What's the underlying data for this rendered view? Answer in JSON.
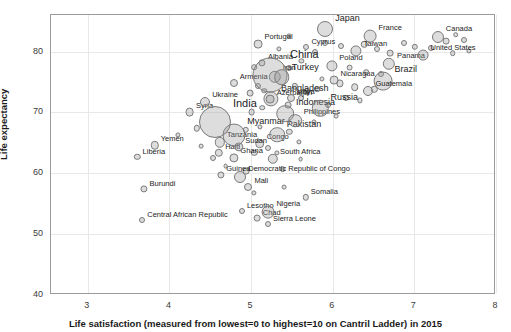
{
  "chart_data": {
    "type": "scatter",
    "title": "",
    "xlabel": "Life satisfaction (measured from lowest=0 to highest=10 on Cantril Ladder) in 2015",
    "ylabel": "Life expectancy",
    "xlim": [
      2.55,
      8.0
    ],
    "ylim": [
      40,
      86
    ],
    "xticks": [
      3,
      4,
      5,
      6,
      7,
      8
    ],
    "yticks": [
      40,
      50,
      60,
      70,
      80
    ],
    "grid": true,
    "legend": "none",
    "size_encodes": "population",
    "points": [
      {
        "label": "Central African Republic",
        "x": 3.68,
        "y": 52.2,
        "r": 3,
        "lp": "right"
      },
      {
        "label": "Liberia",
        "x": 3.62,
        "y": 62.5,
        "r": 3.2,
        "lp": "right"
      },
      {
        "label": "Burundi",
        "x": 3.7,
        "y": 57.2,
        "r": 3.6,
        "lp": "right"
      },
      {
        "label": "Yemen",
        "x": 3.83,
        "y": 64.4,
        "r": 4.2,
        "lp": "right"
      },
      {
        "label": "Syria",
        "x": 4.26,
        "y": 69.9,
        "r": 4.4,
        "lp": "right"
      },
      {
        "label": "Tanzania",
        "x": 4.63,
        "y": 64.9,
        "r": 5.2,
        "lp": "right"
      },
      {
        "label": "Haiti",
        "x": 4.62,
        "y": 63.2,
        "r": 4.2,
        "lp": "right"
      },
      {
        "label": "Ghana",
        "x": 4.8,
        "y": 62.4,
        "r": 4.6,
        "lp": "right"
      },
      {
        "label": "Guinea",
        "x": 4.64,
        "y": 59.6,
        "r": 3.6,
        "lp": "right"
      },
      {
        "label": "Democratic Republic of Congo",
        "x": 4.88,
        "y": 59.3,
        "r": 6.0,
        "lp": "right"
      },
      {
        "label": "Mali",
        "x": 4.98,
        "y": 57.5,
        "r": 4.0,
        "lp": "right"
      },
      {
        "label": "Lesotho",
        "x": 4.9,
        "y": 53.6,
        "r": 3.0,
        "lp": "right"
      },
      {
        "label": "Chad",
        "x": 5.09,
        "y": 52.5,
        "r": 3.4,
        "lp": "right"
      },
      {
        "label": "Nigeria",
        "x": 5.22,
        "y": 53.4,
        "r": 6.4,
        "lp": "right"
      },
      {
        "label": "Sierra Leone",
        "x": 5.22,
        "y": 51.5,
        "r": 3.0,
        "lp": "right"
      },
      {
        "label": "Somalia",
        "x": 5.68,
        "y": 55.9,
        "r": 3.2,
        "lp": "right"
      },
      {
        "label": "South Africa",
        "x": 5.28,
        "y": 62.2,
        "r": 5.2,
        "lp": "right"
      },
      {
        "label": "Congo",
        "x": 5.12,
        "y": 64.7,
        "r": 4.8,
        "lp": "right"
      },
      {
        "label": "Sudan",
        "x": 4.86,
        "y": 64.1,
        "r": 4.6,
        "lp": "right"
      },
      {
        "label": "Myanmar",
        "x": 4.8,
        "y": 66.1,
        "r": 11.5,
        "lp": "right"
      },
      {
        "label": "India",
        "x": 4.57,
        "y": 68.3,
        "r": 16.0,
        "lp": "right",
        "size": "big"
      },
      {
        "label": "Ukraine",
        "x": 4.45,
        "y": 71.5,
        "r": 5.0,
        "lp": "right"
      },
      {
        "label": "Armenia",
        "x": 4.8,
        "y": 74.7,
        "r": 4.0,
        "lp": "right"
      },
      {
        "label": "Albania",
        "x": 5.15,
        "y": 78.0,
        "r": 3.6,
        "lp": "right"
      },
      {
        "label": "Iran",
        "x": 5.3,
        "y": 75.7,
        "r": 6.2,
        "lp": "right"
      },
      {
        "label": "Bangladesh",
        "x": 5.26,
        "y": 72.1,
        "r": 7.6,
        "lp": "right"
      },
      {
        "label": "Pakistan",
        "x": 5.33,
        "y": 66.2,
        "r": 7.8,
        "lp": "right"
      },
      {
        "label": "Indonesia",
        "x": 5.43,
        "y": 69.6,
        "r": 8.8,
        "lp": "right"
      },
      {
        "label": "Azerbaijan",
        "x": 5.25,
        "y": 72.0,
        "r": 4.4,
        "lp": "right"
      },
      {
        "label": "Libya",
        "x": 5.5,
        "y": 72.2,
        "r": 4.0,
        "lp": "right"
      },
      {
        "label": "Philippines",
        "x": 5.55,
        "y": 68.5,
        "r": 6.8,
        "lp": "right"
      },
      {
        "label": "Russia",
        "x": 5.86,
        "y": 70.5,
        "r": 8.2,
        "lp": "right"
      },
      {
        "label": "China",
        "x": 5.25,
        "y": 76.0,
        "r": 17.5,
        "lp": "right",
        "size": "big"
      },
      {
        "label": "Turkey",
        "x": 5.39,
        "y": 75.6,
        "r": 7.8,
        "lp": "right"
      },
      {
        "label": "Portugal",
        "x": 5.1,
        "y": 81.1,
        "r": 4.4,
        "lp": "right"
      },
      {
        "label": "Cyprus",
        "x": 5.69,
        "y": 80.5,
        "r": 3.0,
        "lp": "right"
      },
      {
        "label": "Japan",
        "x": 5.92,
        "y": 83.6,
        "r": 8.0,
        "lp": "right"
      },
      {
        "label": "Poland",
        "x": 6.0,
        "y": 77.5,
        "r": 5.6,
        "lp": "right"
      },
      {
        "label": "Nicaragua",
        "x": 6.03,
        "y": 75.1,
        "r": 4.4,
        "lp": "right"
      },
      {
        "label": "Taiwan",
        "x": 6.3,
        "y": 79.9,
        "r": 5.6,
        "lp": "right"
      },
      {
        "label": "France",
        "x": 6.47,
        "y": 82.4,
        "r": 6.4,
        "lp": "right"
      },
      {
        "label": "Panama",
        "x": 6.7,
        "y": 77.8,
        "r": 6.2,
        "lp": "right"
      },
      {
        "label": "Brazil",
        "x": 6.63,
        "y": 75.0,
        "r": 9.4,
        "lp": "right"
      },
      {
        "label": "Guatemala",
        "x": 6.45,
        "y": 73.3,
        "r": 5.0,
        "lp": "right"
      },
      {
        "label": "Canada",
        "x": 7.3,
        "y": 82.2,
        "r": 6.0,
        "lp": "right"
      },
      {
        "label": "United States",
        "x": 7.12,
        "y": 79.2,
        "r": 5.4,
        "lp": "right"
      }
    ],
    "extra_points": [
      {
        "x": 4.12,
        "y": 66.2,
        "r": 2.6
      },
      {
        "x": 4.35,
        "y": 67.2,
        "r": 3.2
      },
      {
        "x": 4.55,
        "y": 62.3,
        "r": 3.0
      },
      {
        "x": 4.7,
        "y": 61.0,
        "r": 2.4
      },
      {
        "x": 4.95,
        "y": 60.2,
        "r": 3.4
      },
      {
        "x": 4.4,
        "y": 64.3,
        "r": 2.4
      },
      {
        "x": 5.05,
        "y": 56.6,
        "r": 2.6
      },
      {
        "x": 5.42,
        "y": 57.6,
        "r": 2.4
      },
      {
        "x": 5.4,
        "y": 60.5,
        "r": 2.8
      },
      {
        "x": 5.05,
        "y": 63.2,
        "r": 3.2
      },
      {
        "x": 5.22,
        "y": 64.0,
        "r": 3.0
      },
      {
        "x": 5.33,
        "y": 63.2,
        "r": 2.6
      },
      {
        "x": 4.95,
        "y": 67.0,
        "r": 3.2
      },
      {
        "x": 5.12,
        "y": 67.4,
        "r": 2.6
      },
      {
        "x": 5.48,
        "y": 66.6,
        "r": 3.2
      },
      {
        "x": 5.6,
        "y": 65.0,
        "r": 2.6
      },
      {
        "x": 5.02,
        "y": 69.9,
        "r": 3.4
      },
      {
        "x": 5.15,
        "y": 70.6,
        "r": 2.8
      },
      {
        "x": 5.47,
        "y": 71.0,
        "r": 3.4
      },
      {
        "x": 5.62,
        "y": 72.2,
        "r": 3.0
      },
      {
        "x": 5.0,
        "y": 73.0,
        "r": 3.4
      },
      {
        "x": 5.17,
        "y": 73.4,
        "r": 2.8
      },
      {
        "x": 5.1,
        "y": 74.2,
        "r": 3.0
      },
      {
        "x": 5.55,
        "y": 74.1,
        "r": 3.2
      },
      {
        "x": 5.7,
        "y": 73.4,
        "r": 3.0
      },
      {
        "x": 5.82,
        "y": 73.6,
        "r": 2.8
      },
      {
        "x": 5.05,
        "y": 77.3,
        "r": 2.8
      },
      {
        "x": 5.48,
        "y": 77.2,
        "r": 3.0
      },
      {
        "x": 5.63,
        "y": 78.3,
        "r": 2.6
      },
      {
        "x": 5.8,
        "y": 79.8,
        "r": 3.0
      },
      {
        "x": 5.48,
        "y": 82.4,
        "r": 2.6
      },
      {
        "x": 5.92,
        "y": 81.3,
        "r": 3.0
      },
      {
        "x": 6.12,
        "y": 80.7,
        "r": 3.0
      },
      {
        "x": 6.22,
        "y": 77.2,
        "r": 3.4
      },
      {
        "x": 6.1,
        "y": 74.6,
        "r": 3.6
      },
      {
        "x": 6.28,
        "y": 74.0,
        "r": 3.8
      },
      {
        "x": 6.18,
        "y": 72.2,
        "r": 3.0
      },
      {
        "x": 5.95,
        "y": 71.0,
        "r": 3.0
      },
      {
        "x": 5.78,
        "y": 68.3,
        "r": 2.6
      },
      {
        "x": 5.62,
        "y": 62.1,
        "r": 2.4
      },
      {
        "x": 6.4,
        "y": 81.0,
        "r": 3.2
      },
      {
        "x": 6.55,
        "y": 80.2,
        "r": 3.0
      },
      {
        "x": 6.72,
        "y": 79.6,
        "r": 3.4
      },
      {
        "x": 6.88,
        "y": 81.3,
        "r": 3.0
      },
      {
        "x": 7.02,
        "y": 80.6,
        "r": 3.2
      },
      {
        "x": 7.22,
        "y": 80.4,
        "r": 3.0
      },
      {
        "x": 7.4,
        "y": 81.5,
        "r": 3.4
      },
      {
        "x": 7.52,
        "y": 82.6,
        "r": 2.8
      },
      {
        "x": 7.62,
        "y": 81.7,
        "r": 3.0
      },
      {
        "x": 7.48,
        "y": 79.6,
        "r": 2.8
      },
      {
        "x": 7.68,
        "y": 80.0,
        "r": 2.6
      },
      {
        "x": 6.6,
        "y": 76.2,
        "r": 3.0
      },
      {
        "x": 6.42,
        "y": 76.4,
        "r": 2.8
      },
      {
        "x": 6.35,
        "y": 71.8,
        "r": 2.6
      },
      {
        "x": 6.52,
        "y": 73.6,
        "r": 3.2
      },
      {
        "x": 5.35,
        "y": 80.2,
        "r": 2.6
      },
      {
        "x": 5.88,
        "y": 75.4,
        "r": 2.6
      },
      {
        "x": 6.05,
        "y": 69.2,
        "r": 2.4
      }
    ]
  }
}
